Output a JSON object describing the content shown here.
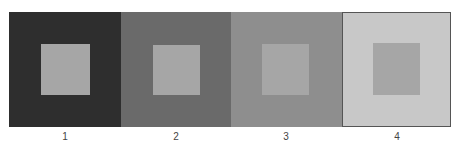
{
  "figure": {
    "panels": [
      {
        "label": "1",
        "outer_color": "#2e2e2e",
        "inner_color": "#a6a6a6"
      },
      {
        "label": "2",
        "outer_color": "#6a6a6a",
        "inner_color": "#a6a6a6"
      },
      {
        "label": "3",
        "outer_color": "#8e8e8e",
        "inner_color": "#a6a6a6"
      },
      {
        "label": "4",
        "outer_color": "#c8c8c8",
        "inner_color": "#a6a6a6"
      }
    ]
  }
}
